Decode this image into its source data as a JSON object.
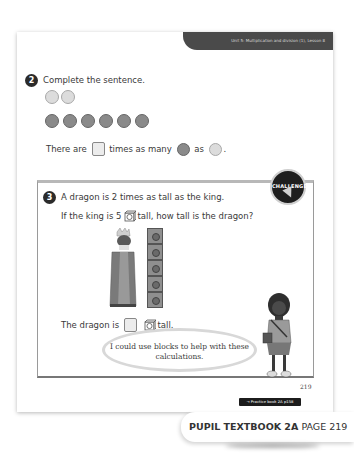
{
  "header": {
    "unit_banner": "Unit 5: Multiplication and division (1), Lesson 8"
  },
  "question2": {
    "number": "2",
    "prompt": "Complete the sentence.",
    "light_circles_count": 2,
    "dark_circles_count": 6,
    "sentence": {
      "part1": "There are",
      "part2": "times as many",
      "part3": "as",
      "part4": "."
    }
  },
  "question3": {
    "number": "3",
    "badge": "CHALLENGE",
    "line1": "A dragon is 2 times as tall as the king.",
    "line2_before": "If the king is 5",
    "line2_after": "tall, how tall is the dragon?",
    "tower_blocks": 5,
    "answer_before": "The dragon is",
    "answer_after": "tall.",
    "speech_bubble": "I could use blocks to help with these calculations."
  },
  "footer": {
    "page_number": "219",
    "practice_link": "→ Practice book 2A p158",
    "book_title": "PUPIL TEXTBOOK 2A",
    "page_label": "PAGE 219"
  },
  "colors": {
    "banner": "#4a4a4a",
    "light_counter": "#dcdcdc",
    "dark_counter": "#8a8a8a"
  }
}
